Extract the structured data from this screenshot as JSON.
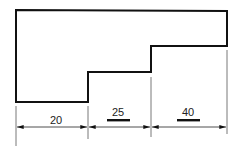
{
  "drawing": {
    "type": "stepped-profile-dimension-drawing",
    "outline_points": [
      [
        16,
        10
      ],
      [
        227,
        11
      ],
      [
        227,
        46
      ],
      [
        151,
        46
      ],
      [
        151,
        72
      ],
      [
        88,
        72
      ],
      [
        88,
        102
      ],
      [
        16,
        102
      ]
    ],
    "extension_lines_x": [
      16,
      88,
      151,
      227
    ],
    "dimension_line_y": 127
  },
  "dimensions": [
    {
      "label": "20",
      "from_x": 16,
      "to_x": 88,
      "underlined": false
    },
    {
      "label": "25",
      "from_x": 88,
      "to_x": 151,
      "underlined": true
    },
    {
      "label": "40",
      "from_x": 151,
      "to_x": 227,
      "underlined": true
    }
  ]
}
